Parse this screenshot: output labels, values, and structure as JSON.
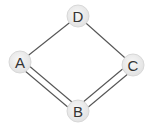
{
  "diagram": {
    "type": "graph",
    "nodes": [
      {
        "id": "D",
        "label": "D",
        "x": 78,
        "y": 16
      },
      {
        "id": "A",
        "label": "A",
        "x": 20,
        "y": 62
      },
      {
        "id": "C",
        "label": "C",
        "x": 133,
        "y": 65
      },
      {
        "id": "B",
        "label": "B",
        "x": 78,
        "y": 111
      }
    ],
    "edges": [
      {
        "from": "A",
        "to": "D",
        "style": "single"
      },
      {
        "from": "D",
        "to": "C",
        "style": "single"
      },
      {
        "from": "A",
        "to": "B",
        "style": "double"
      },
      {
        "from": "B",
        "to": "C",
        "style": "double"
      }
    ],
    "colors": {
      "edge": "#555555",
      "node_fill": "#eeeeee",
      "node_stroke": "#dddddd",
      "label": "#333333"
    }
  }
}
